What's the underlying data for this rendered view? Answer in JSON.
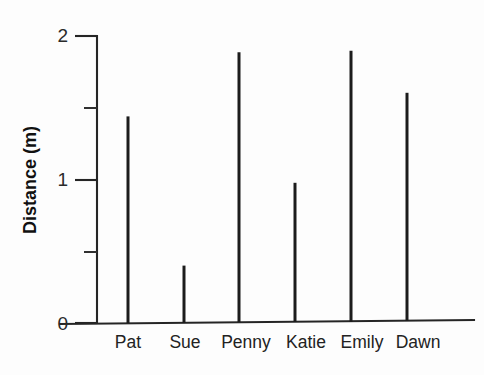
{
  "chart_data": {
    "type": "bar",
    "title": "",
    "subtitle": "",
    "xlabel": "",
    "ylabel": "Distance (m)",
    "categories": [
      "Pat",
      "Sue",
      "Penny",
      "Katie",
      "Emily",
      "Dawn"
    ],
    "values": [
      1.44,
      0.4,
      1.88,
      0.97,
      1.89,
      1.59
    ],
    "ylim": [
      0,
      2
    ],
    "y_major_ticks": [
      0,
      1,
      2
    ],
    "y_major_tick_labels": [
      "0",
      "1",
      "2"
    ],
    "y_minor_ticks": [
      0.5,
      1.5
    ],
    "grid": false,
    "legend": false,
    "legend_position": "none",
    "style": {
      "bar_style": "thin-stick",
      "line_color": "#1c1c1c",
      "axis_color": "#252525",
      "background": "#ffffff"
    }
  },
  "axis": {
    "y_title": "Distance (m)"
  }
}
